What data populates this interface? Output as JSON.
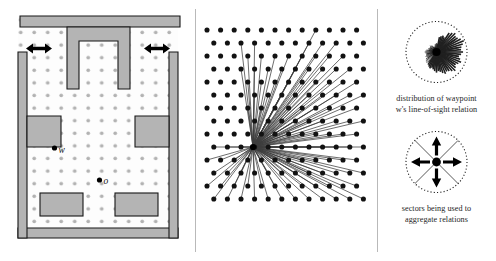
{
  "figure": {
    "panels": [
      "environment-map",
      "line-of-sight-fan",
      "legend-diagrams"
    ]
  },
  "map": {
    "label_waypoint": "w",
    "label_object": "o",
    "wall_fill": "#b3b3b3",
    "wall_stroke": "#1a1a1a",
    "floor_fill": "#fdfdfd",
    "grid_dot_color": "#b0b0b0",
    "point_color": "#000000",
    "doorway_arrows": 2,
    "grid_dots": {
      "rows": 17,
      "cols": 11,
      "spacing_x": 13.5,
      "spacing_y": 12.6
    },
    "waypoint": {
      "x": 55,
      "y": 148
    },
    "object": {
      "x": 100,
      "y": 180
    }
  },
  "los": {
    "dot_color": "#111111",
    "line_color": "#3a3a3a",
    "center": {
      "x": 57,
      "y": 147
    },
    "rows": 14,
    "cols": 12,
    "ray_count": 62,
    "description": "rays from waypoint to every visible grid node"
  },
  "legend": {
    "rose": {
      "wedge_color": "#202020",
      "hub_color": "#000000",
      "rim_style": "dotted",
      "spokes": 16,
      "caption_line1": "distribution of waypoint",
      "caption_line2": "w's  line-of-sight relation"
    },
    "sectors": {
      "arrow_color": "#000000",
      "hub_color": "#000000",
      "rim_style": "dotted",
      "sector_count": 4,
      "arrow_directions": [
        "up",
        "right",
        "down",
        "left"
      ],
      "caption_line1": "sectors being used to",
      "caption_line2": "aggregate relations"
    }
  },
  "chart_data": {
    "type": "bar",
    "title": "distribution of waypoint w's line-of-sight relation",
    "xlabel": "direction (degrees, polar)",
    "ylabel": "number of line-of-sight relations",
    "categories": [
      "0",
      "22.5",
      "45",
      "67.5",
      "90",
      "112.5",
      "135",
      "157.5",
      "180",
      "202.5",
      "225",
      "247.5",
      "270",
      "292.5",
      "315",
      "337.5"
    ],
    "values": [
      9,
      10,
      9,
      6,
      3,
      2,
      3,
      3,
      4,
      4,
      5,
      6,
      7,
      8,
      9,
      9
    ],
    "ylim": [
      0,
      10
    ],
    "legend": [],
    "grid": false
  }
}
